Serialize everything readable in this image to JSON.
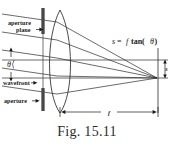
{
  "figure": {
    "caption": "Fig. 15.11",
    "labels": {
      "aperture_plane_line1": "aperture",
      "aperture_plane_line2": "plane",
      "wavefront": "wavefront",
      "aperture": "aperture",
      "theta": "θ",
      "focal_length": "f",
      "image_height": "s"
    },
    "equation": {
      "lhs": "s",
      "equals": "=",
      "rhs_f": "f",
      "rhs_fn": "tan(",
      "rhs_theta": "θ",
      "rhs_close": ")",
      "full": "s = f tan(θ)"
    },
    "colors": {
      "ink": "#1a1a1a",
      "ray": "#2b2b2b",
      "aperture_blade": "#555555",
      "background": "#ffffff",
      "caption": "#2a2a2a"
    },
    "geometry": {
      "optical_axis_y": 78,
      "aperture_plane_x": 43,
      "lens_center_x": 60,
      "focal_plane_x": 158,
      "focal_point_y": 78,
      "image_point_y": 63,
      "tilt_angle_deg": 8
    }
  }
}
